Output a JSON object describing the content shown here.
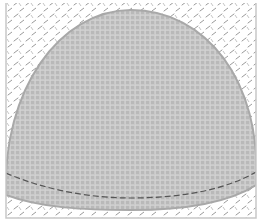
{
  "figure": {
    "colors": {
      "background": "#ffffff",
      "frame": "#c8c8c8",
      "tread_mark": "#9a9a9a",
      "dome_fill": "#bdbdbd",
      "dome_grid": "#d6d6d6",
      "dome_edge": "#a8a8a8",
      "dashed_line": "#555555"
    },
    "patterns": {
      "background": "diamond-plate",
      "dome": "square-grid"
    }
  }
}
